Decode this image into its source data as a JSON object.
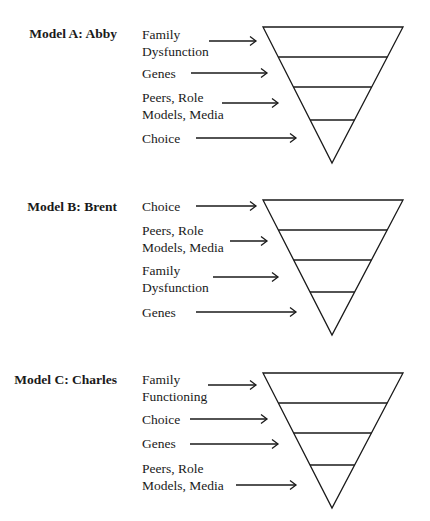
{
  "models": [
    {
      "title": "Model A: Abby",
      "title_y": 27,
      "triangle": {
        "top": 27,
        "left": 263,
        "right": 403,
        "apex_x": 332,
        "apex_y": 163,
        "dividers": [
          57,
          87,
          120
        ]
      },
      "layers": [
        {
          "line1": "Family",
          "line2": "Dysfunction",
          "text_y": 26,
          "arrow": {
            "x1": 209,
            "x2": 256,
            "y": 41
          }
        },
        {
          "line1": "Genes",
          "line2": "",
          "text_y": 65,
          "arrow": {
            "x1": 191,
            "x2": 267,
            "y": 73
          }
        },
        {
          "line1": "Peers, Role",
          "line2": "Models, Media",
          "text_y": 89,
          "arrow": {
            "x1": 222,
            "x2": 278,
            "y": 103
          }
        },
        {
          "line1": "Choice",
          "line2": "",
          "text_y": 130,
          "arrow": {
            "x1": 196,
            "x2": 296,
            "y": 138
          }
        }
      ]
    },
    {
      "title": "Model B: Brent",
      "title_y": 200,
      "triangle": {
        "top": 200,
        "left": 263,
        "right": 403,
        "apex_x": 332,
        "apex_y": 335,
        "dividers": [
          230,
          260,
          292
        ]
      },
      "layers": [
        {
          "line1": "Choice",
          "line2": "",
          "text_y": 198,
          "arrow": {
            "x1": 196,
            "x2": 256,
            "y": 206
          }
        },
        {
          "line1": "Peers, Role",
          "line2": "Models, Media",
          "text_y": 222,
          "arrow": {
            "x1": 230,
            "x2": 267,
            "y": 241
          }
        },
        {
          "line1": "Family",
          "line2": "Dysfunction",
          "text_y": 262,
          "arrow": {
            "x1": 213,
            "x2": 278,
            "y": 277
          }
        },
        {
          "line1": "Genes",
          "line2": "",
          "text_y": 304,
          "arrow": {
            "x1": 196,
            "x2": 296,
            "y": 312
          }
        }
      ]
    },
    {
      "title": "Model C: Charles",
      "title_y": 373,
      "triangle": {
        "top": 373,
        "left": 263,
        "right": 403,
        "apex_x": 332,
        "apex_y": 508,
        "dividers": [
          403,
          433,
          465
        ]
      },
      "layers": [
        {
          "line1": "Family",
          "line2": "Functioning",
          "text_y": 371,
          "arrow": {
            "x1": 208,
            "x2": 256,
            "y": 385
          }
        },
        {
          "line1": "Choice",
          "line2": "",
          "text_y": 411,
          "arrow": {
            "x1": 190,
            "x2": 267,
            "y": 419
          }
        },
        {
          "line1": "Genes",
          "line2": "",
          "text_y": 435,
          "arrow": {
            "x1": 190,
            "x2": 278,
            "y": 444
          }
        },
        {
          "line1": "Peers, Role",
          "line2": "Models, Media",
          "text_y": 460,
          "arrow": {
            "x1": 236,
            "x2": 296,
            "y": 485
          }
        }
      ]
    }
  ],
  "colors": {
    "line": "#1a1a1a",
    "background": "#ffffff"
  }
}
